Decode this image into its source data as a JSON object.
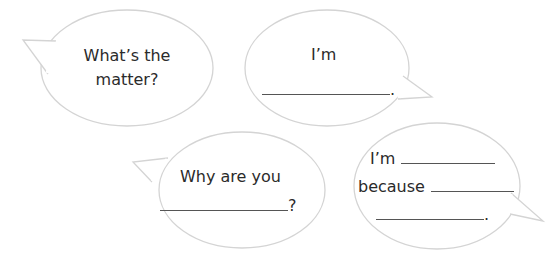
{
  "worksheet": {
    "bubble_stroke_color": "#d4d4d4",
    "text_color": "#2b2b2b",
    "bubbles": [
      {
        "id": "bubble-1",
        "tail": "left",
        "lines": [
          "What’s the",
          "matter?"
        ]
      },
      {
        "id": "bubble-2",
        "tail": "right",
        "lines": [
          "I’m"
        ],
        "blank_end_punctuation": "."
      },
      {
        "id": "bubble-3",
        "tail": "left",
        "lines": [
          "Why are you"
        ],
        "blank_end_punctuation": "?"
      },
      {
        "id": "bubble-4",
        "tail": "right",
        "line1_prefix": "I’m",
        "line2_prefix": "because",
        "blank_end_punctuation": "."
      }
    ]
  }
}
